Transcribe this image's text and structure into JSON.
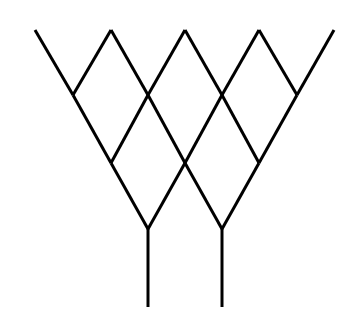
{
  "diagram": {
    "type": "lattice-tree",
    "stroke_color": "#000000",
    "background_color": "#ffffff",
    "stroke_width": 3,
    "nodes": {
      "top": [
        [
          35,
          30
        ],
        [
          111,
          30
        ],
        [
          185,
          30
        ],
        [
          259,
          30
        ],
        [
          334,
          30
        ]
      ],
      "row1": [
        [
          73,
          95
        ],
        [
          148,
          95
        ],
        [
          222,
          95
        ],
        [
          297,
          95
        ]
      ],
      "row2": [
        [
          111,
          163
        ],
        [
          185,
          163
        ],
        [
          259,
          163
        ]
      ],
      "row3": [
        [
          148,
          229
        ],
        [
          222,
          229
        ]
      ],
      "stem_bottoms": [
        [
          148,
          307
        ],
        [
          222,
          307
        ]
      ]
    },
    "edges": [
      [
        [
          35,
          30
        ],
        [
          73,
          95
        ]
      ],
      [
        [
          111,
          30
        ],
        [
          73,
          95
        ]
      ],
      [
        [
          111,
          30
        ],
        [
          148,
          95
        ]
      ],
      [
        [
          185,
          30
        ],
        [
          148,
          95
        ]
      ],
      [
        [
          185,
          30
        ],
        [
          222,
          95
        ]
      ],
      [
        [
          259,
          30
        ],
        [
          222,
          95
        ]
      ],
      [
        [
          259,
          30
        ],
        [
          297,
          95
        ]
      ],
      [
        [
          334,
          30
        ],
        [
          297,
          95
        ]
      ],
      [
        [
          73,
          95
        ],
        [
          111,
          163
        ]
      ],
      [
        [
          148,
          95
        ],
        [
          111,
          163
        ]
      ],
      [
        [
          148,
          95
        ],
        [
          185,
          163
        ]
      ],
      [
        [
          222,
          95
        ],
        [
          185,
          163
        ]
      ],
      [
        [
          222,
          95
        ],
        [
          259,
          163
        ]
      ],
      [
        [
          297,
          95
        ],
        [
          259,
          163
        ]
      ],
      [
        [
          111,
          163
        ],
        [
          148,
          229
        ]
      ],
      [
        [
          185,
          163
        ],
        [
          148,
          229
        ]
      ],
      [
        [
          185,
          163
        ],
        [
          222,
          229
        ]
      ],
      [
        [
          259,
          163
        ],
        [
          222,
          229
        ]
      ],
      [
        [
          148,
          229
        ],
        [
          148,
          307
        ]
      ],
      [
        [
          222,
          229
        ],
        [
          222,
          307
        ]
      ]
    ]
  }
}
